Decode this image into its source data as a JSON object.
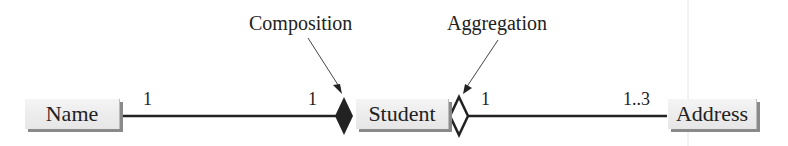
{
  "diagram": {
    "classes": [
      {
        "id": "name",
        "label": "Name"
      },
      {
        "id": "student",
        "label": "Student"
      },
      {
        "id": "address",
        "label": "Address"
      }
    ],
    "relationships": [
      {
        "type": "composition",
        "label": "Composition",
        "from": "name",
        "to": "student",
        "from_multiplicity": "1",
        "to_multiplicity": "1"
      },
      {
        "type": "aggregation",
        "label": "Aggregation",
        "from": "address",
        "to": "student",
        "from_multiplicity": "1..3",
        "to_multiplicity": "1"
      }
    ]
  },
  "colors": {
    "line": "#222222",
    "box_fill": "#eeeeee",
    "shadow": "#8a8a8a"
  }
}
